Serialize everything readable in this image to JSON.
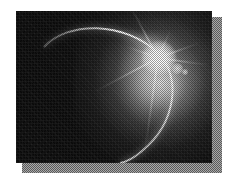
{
  "page": {
    "background_color": "#ffffff",
    "width": 227,
    "height": 187
  },
  "photo": {
    "name": "eclipse-photograph",
    "alt_text": "Grayscale halftone photograph of a solar eclipse: a thin bright crescent arc of a planetary limb with a brilliant starburst flare at the upper right",
    "frame": {
      "x": 16,
      "y": 11,
      "width": 196,
      "height": 152
    },
    "sky_color": "#090909",
    "highlight_color": "#ffffff",
    "glow_color": "#c8c8c8",
    "rendering": "halftone-dither"
  },
  "shadow": {
    "name": "drop-shadow",
    "color": "#868686",
    "dither_dark": "#5a5a5a",
    "dither_light": "#a8a8a8",
    "offset_x": 10,
    "offset_y": 10
  },
  "elements": {
    "limb_arc": {
      "label": "crescent-limb-arc",
      "description": "thin bright curved edge sweeping from upper-left across the top and down the right side"
    },
    "flare": {
      "label": "starburst-flare",
      "center_x": 142,
      "center_y": 46,
      "spike_count": 8,
      "spike_angles": [
        -118,
        -66,
        -20,
        8,
        42,
        98,
        152,
        200
      ],
      "spike_lengths": [
        58,
        30,
        44,
        52,
        26,
        96,
        72,
        34
      ]
    },
    "ghosts": [
      {
        "label": "lens-flare-ghost-large"
      },
      {
        "label": "lens-flare-ghost-small"
      }
    ]
  }
}
